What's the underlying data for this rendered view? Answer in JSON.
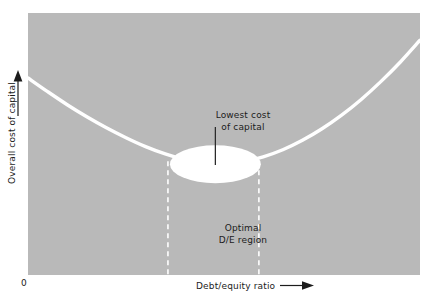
{
  "chart_data": {
    "type": "line",
    "title": "",
    "subtitle": "",
    "xlabel": "Debt/equity ratio",
    "ylabel": "Overall cost of capital",
    "origin_label": "0",
    "xlim": [
      0,
      1
    ],
    "ylim": [
      0,
      1
    ],
    "grid": false,
    "legend": null,
    "axis_style": {
      "x_arrow": true,
      "y_arrow": true,
      "ticks": false,
      "tick_labels": false
    },
    "background_color": "#b9b9b9",
    "curve_color": "#ffffff",
    "text_color": "#1c1c1c",
    "series": [
      {
        "name": "Overall cost of capital (WACC)",
        "shape": "u-curve",
        "color": "#ffffff",
        "points": [
          {
            "x": 0.0,
            "y": 0.752
          },
          {
            "x": 0.05,
            "y": 0.7
          },
          {
            "x": 0.1,
            "y": 0.65
          },
          {
            "x": 0.15,
            "y": 0.604
          },
          {
            "x": 0.2,
            "y": 0.562
          },
          {
            "x": 0.25,
            "y": 0.524
          },
          {
            "x": 0.3,
            "y": 0.49
          },
          {
            "x": 0.35,
            "y": 0.462
          },
          {
            "x": 0.4,
            "y": 0.44
          },
          {
            "x": 0.45,
            "y": 0.426
          },
          {
            "x": 0.478,
            "y": 0.423
          },
          {
            "x": 0.5,
            "y": 0.424
          },
          {
            "x": 0.55,
            "y": 0.433
          },
          {
            "x": 0.6,
            "y": 0.451
          },
          {
            "x": 0.65,
            "y": 0.478
          },
          {
            "x": 0.7,
            "y": 0.514
          },
          {
            "x": 0.75,
            "y": 0.558
          },
          {
            "x": 0.8,
            "y": 0.61
          },
          {
            "x": 0.85,
            "y": 0.67
          },
          {
            "x": 0.9,
            "y": 0.738
          },
          {
            "x": 0.95,
            "y": 0.813
          },
          {
            "x": 1.0,
            "y": 0.896
          }
        ],
        "minimum": {
          "x": 0.478,
          "y": 0.423
        }
      }
    ],
    "annotations": [
      {
        "name": "lowest-cost-of-capital",
        "text": "Lowest cost\nof capital",
        "line1": "Lowest cost",
        "line2": "of capital",
        "x": 0.478,
        "y": 0.62,
        "pointer": true,
        "pointer_target": {
          "x": 0.478,
          "y": 0.435
        },
        "color": "#1c1c1c"
      },
      {
        "name": "optimal-de-region",
        "text": "Optimal\nD/E region",
        "line1": "Optimal",
        "line2": "D/E region",
        "x": 0.478,
        "y": 0.19,
        "pointer": false,
        "color": "#1c1c1c"
      }
    ],
    "highlight_ellipse": {
      "name": "lowest-cost-highlight",
      "center": {
        "x": 0.478,
        "y": 0.423
      },
      "width_frac": 0.232,
      "height_frac": 0.145,
      "color": "#ffffff"
    },
    "region_bounds": {
      "name": "optimal-de-region-bounds",
      "x_left": 0.357,
      "x_right": 0.589,
      "y_top": 0.423,
      "y_bottom": 0.0,
      "line_style": "dashed",
      "color": "#ffffff"
    }
  },
  "chart": {
    "xlabel": "Debt/equity ratio",
    "ylabel": "Overall cost of capital",
    "origin_label": "0",
    "lowest_cost_line1": "Lowest cost",
    "lowest_cost_line2": "of capital",
    "optimal_line1": "Optimal",
    "optimal_line2": "D/E region"
  }
}
